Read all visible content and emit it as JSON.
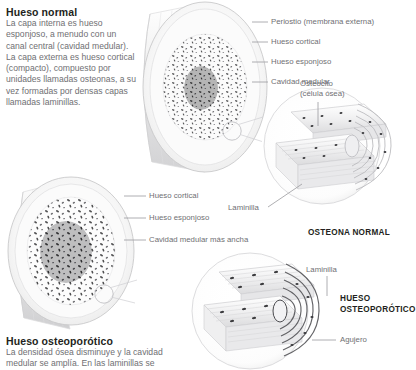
{
  "figure": {
    "language": "es",
    "background_color": "#ffffff",
    "text_color": "#231f20",
    "muted_text_color": "#6f6f73",
    "leader_line_color": "#9a9a9e"
  },
  "normal_section": {
    "title": "Hueso normal",
    "body": "La capa interna es hueso esponjoso, a menudo con un canal central (cavidad medular). La capa externa es hueso cortical (compacto), compuesto por unidades llamadas osteonas, a su vez formadas por densas capas llamadas laminillas."
  },
  "osteoporotic_section": {
    "title": "Hueso osteoporótico",
    "body": "La densidad ósea disminuye y la cavidad medular se amplía. En las laminillas se"
  },
  "normal_bone_labels": [
    {
      "id": "periostio",
      "text": "Periostio (membrana externa)"
    },
    {
      "id": "hueso-cortical",
      "text": "Hueso cortical"
    },
    {
      "id": "hueso-esponjoso",
      "text": "Hueso esponjoso"
    },
    {
      "id": "cavidad-medular",
      "text": "Cavidad medular"
    }
  ],
  "osteoporotic_bone_labels": [
    {
      "id": "hueso-cortical-2",
      "text": "Hueso cortical"
    },
    {
      "id": "hueso-esponjoso-2",
      "text": "Hueso esponjoso"
    },
    {
      "id": "cavidad-medular-ancha",
      "text": "Cavidad medular más ancha"
    }
  ],
  "normal_osteon": {
    "caption": "OSTEONA NORMAL",
    "labels": [
      {
        "id": "osteocito",
        "text": "Osteocito\n(célula ósea)",
        "line1": "Osteocito",
        "line2": "(célula ósea)"
      },
      {
        "id": "laminilla",
        "text": "Laminilla"
      }
    ]
  },
  "osteoporotic_osteon": {
    "caption_line1": "HUESO",
    "caption_line2": "OSTEOPORÓTICO",
    "labels": [
      {
        "id": "laminilla-2",
        "text": "Laminilla"
      },
      {
        "id": "agujero",
        "text": "Agujero"
      }
    ]
  }
}
